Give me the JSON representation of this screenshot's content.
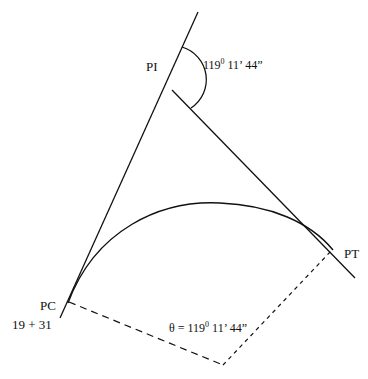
{
  "diagram": {
    "type": "horizontal-curve",
    "colors": {
      "line": "#111111",
      "background": "#ffffff"
    },
    "points": {
      "PI": {
        "label": "PI"
      },
      "PC": {
        "label": "PC",
        "station": "19 + 31"
      },
      "PT": {
        "label": "PT"
      }
    },
    "angles": {
      "deflection_label": {
        "value": "119",
        "sup": "0",
        "rest": " 11’ 44”"
      },
      "central_label": {
        "prefix": "θ = ",
        "value": "119",
        "sup": "0",
        "rest": " 11’ 44”"
      }
    }
  }
}
